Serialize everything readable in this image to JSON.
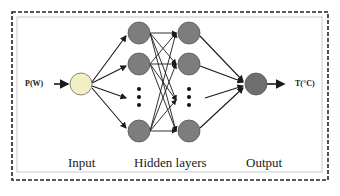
{
  "diagram": {
    "type": "neural-network",
    "input_label": "P(W)",
    "output_label": "T(°C)",
    "captions": {
      "input": "Input",
      "hidden": "Hidden layers",
      "output": "Output"
    },
    "colors": {
      "input_node": "#f2efc4",
      "hidden_node": "#7d7d7d",
      "output_node": "#6e6e6e",
      "edges": "#1a1a1a",
      "border": "#222222"
    },
    "layers": [
      {
        "name": "input",
        "nodes": 1
      },
      {
        "name": "hidden-1",
        "nodes": 3,
        "ellipsis": true
      },
      {
        "name": "hidden-2",
        "nodes": 3,
        "ellipsis": true
      },
      {
        "name": "output",
        "nodes": 1
      }
    ]
  }
}
